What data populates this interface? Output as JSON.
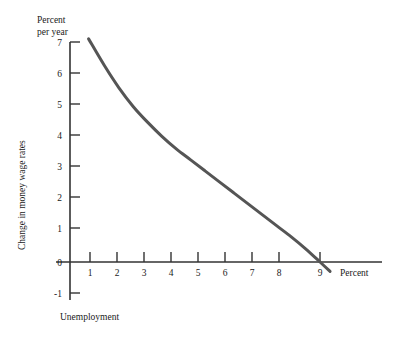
{
  "chart_data": {
    "type": "line",
    "title": "",
    "subtitle": "",
    "xlabel": "Unemployment",
    "ylabel": "Change in money wage rates",
    "x_unit_label": "Percent",
    "y_unit_label_line1": "Percent",
    "y_unit_label_line2": "per year",
    "xlim": [
      0,
      11.3
    ],
    "ylim": [
      -1,
      7.3
    ],
    "xticks": [
      1,
      2,
      3,
      4,
      5,
      6,
      7,
      8,
      9
    ],
    "xtick_labels": [
      "1",
      "2",
      "3",
      "4",
      "5",
      "6",
      "7",
      "8",
      "9"
    ],
    "yticks": [
      -1,
      0,
      1,
      2,
      3,
      4,
      5,
      6,
      7
    ],
    "ytick_labels": [
      "-1",
      "0",
      "1",
      "2",
      "3",
      "4",
      "5",
      "6",
      "7"
    ],
    "grid": false,
    "legend": null,
    "series": [
      {
        "name": "Phillips curve",
        "color": "#555555",
        "line_width": 3,
        "x": [
          0.95,
          1.5,
          2.0,
          2.5,
          3.0,
          3.5,
          4.0,
          4.5,
          5.0,
          5.5,
          6.0,
          6.5,
          7.0,
          7.5,
          8.0,
          8.5,
          9.0,
          9.35
        ],
        "y": [
          7.1,
          6.25,
          5.55,
          4.95,
          4.45,
          4.0,
          3.6,
          3.25,
          2.9,
          2.55,
          2.2,
          1.85,
          1.5,
          1.15,
          0.8,
          0.42,
          0.0,
          -0.3
        ]
      }
    ],
    "annotations": []
  },
  "axes": {
    "x_axis_name": "x-axis",
    "y_axis_name": "y-axis"
  }
}
